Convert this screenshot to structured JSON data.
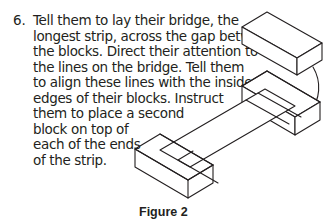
{
  "step": {
    "number": "6.",
    "lines": [
      "Tell them to lay their bridge, the",
      "longest strip, across the gap between",
      "the blocks. Direct their attention to",
      "the lines on the bridge. Tell them",
      "to align these lines with the inside",
      "edges of their blocks. Instruct",
      "them to place a second",
      "block on top of",
      "each of the ends",
      "of the strip."
    ]
  },
  "figure": {
    "caption": "Figure 2",
    "icon": "bridge-blocks-isometric-illustration",
    "stroke_color": "#231f20"
  }
}
